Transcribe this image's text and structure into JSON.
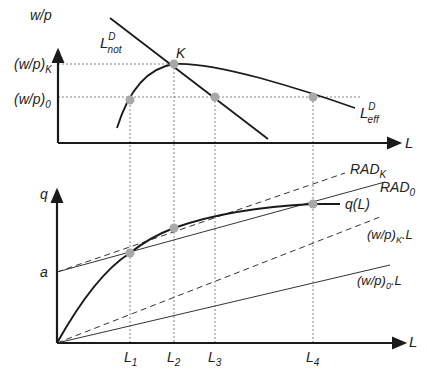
{
  "top_panel": {
    "y_axis_label": "w/p",
    "x_axis_label": "L",
    "tick_wk": "(w/p)",
    "tick_wk_sub": "K",
    "tick_w0": "(w/p)",
    "tick_w0_sub": "0",
    "curve_not": {
      "main": "L",
      "sup": "D",
      "sub": "not"
    },
    "curve_eff": {
      "main": "L",
      "sup": "D",
      "sub": "eff"
    },
    "point_K": "K"
  },
  "bottom_panel": {
    "y_axis_label": "q",
    "x_axis_label": "L",
    "intercept_label": "a",
    "curve_q": "q(L)",
    "rad_k": {
      "main": "RAD",
      "sub": "K"
    },
    "rad_0": {
      "main": "RAD",
      "sub": "0"
    },
    "line_wk": {
      "pre": "(w/p)",
      "sub": "K",
      "post": ".L"
    },
    "line_w0": {
      "pre": "(w/p)",
      "sub": "0",
      "post": ".L"
    },
    "ticks": [
      {
        "main": "L",
        "sub": "1"
      },
      {
        "main": "L",
        "sub": "2"
      },
      {
        "main": "L",
        "sub": "3"
      },
      {
        "main": "L",
        "sub": "4"
      }
    ]
  },
  "colors": {
    "line": "#1a1a1a",
    "point": "#a8a8a8",
    "guide": "#555555"
  }
}
